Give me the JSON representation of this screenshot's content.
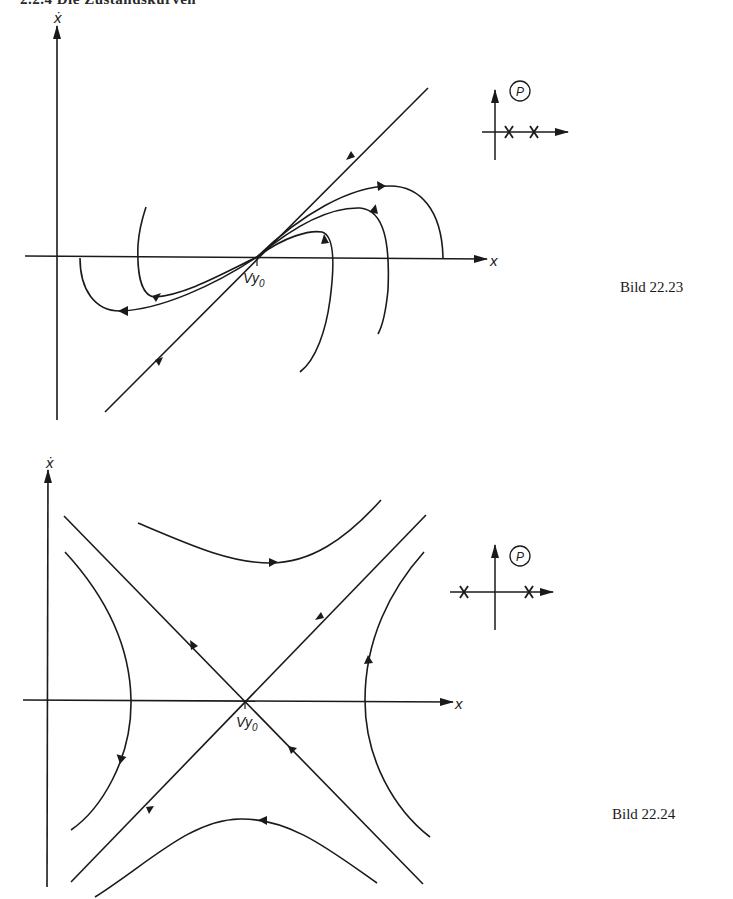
{
  "page": {
    "header": "2.2.4 Die Zustandskurven"
  },
  "figures": [
    {
      "id": "fig-22-23",
      "caption": "Bild 22.23",
      "type": "phase-portrait",
      "equilibrium": "unstable node",
      "axes": {
        "x_label": "x",
        "y_label": "ẋ",
        "origin_label": "y",
        "origin_subscript": "0"
      },
      "pole_diagram": {
        "label": "P",
        "poles": [
          "real positive",
          "real positive"
        ],
        "poles_description": "two real poles on positive real axis"
      }
    },
    {
      "id": "fig-22-24",
      "caption": "Bild 22.24",
      "type": "phase-portrait",
      "equilibrium": "saddle point",
      "axes": {
        "x_label": "x",
        "y_label": "ẋ",
        "origin_label": "y",
        "origin_subscript": "0"
      },
      "pole_diagram": {
        "label": "P",
        "poles": [
          "real negative",
          "real positive"
        ],
        "poles_description": "one real pole on each side of imaginary axis"
      }
    }
  ],
  "colors": {
    "ink": "#1a1a1a",
    "paper": "#ffffff"
  }
}
